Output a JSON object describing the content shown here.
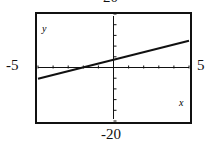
{
  "chart_data": {
    "type": "line",
    "title": "",
    "xlabel": "x",
    "ylabel": "y",
    "xlim": [
      -5,
      5
    ],
    "ylim": [
      -20,
      20
    ],
    "window_labels": {
      "top": "20",
      "bottom": "-20",
      "left": "-5",
      "right": "5"
    },
    "x_tick_step": 1,
    "y_tick_step": 4,
    "grid": false,
    "series": [
      {
        "name": "line",
        "x": [
          -5,
          0,
          5
        ],
        "y": [
          -4.2,
          2.9,
          10
        ]
      }
    ]
  }
}
